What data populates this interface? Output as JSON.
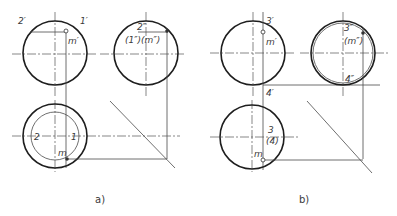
{
  "figure": {
    "panels": [
      {
        "id": "a",
        "caption": "a)",
        "front_view": {
          "labels": {
            "left_point": "2′",
            "right_point": "1′",
            "point": "m′"
          }
        },
        "side_view": {
          "labels": {
            "top_point": "2″",
            "hidden_points": "(1″)(m″)"
          }
        },
        "top_view": {
          "labels": {
            "left_point": "2",
            "right_point": "1",
            "point": "m"
          }
        }
      },
      {
        "id": "b",
        "caption": "b)",
        "front_view": {
          "labels": {
            "top_point": "3′",
            "point": "m′",
            "bottom_point": "4′"
          }
        },
        "side_view": {
          "labels": {
            "top_point": "3″",
            "hidden_point": "(m″)",
            "bottom_point": "4″"
          }
        },
        "top_view": {
          "labels": {
            "top_point": "3",
            "hidden_point": "(4)",
            "point": "m"
          }
        }
      }
    ]
  },
  "colors": {
    "line": "#1e1e1e",
    "thin_line": "#4a4a4a",
    "background": "#ffffff"
  }
}
